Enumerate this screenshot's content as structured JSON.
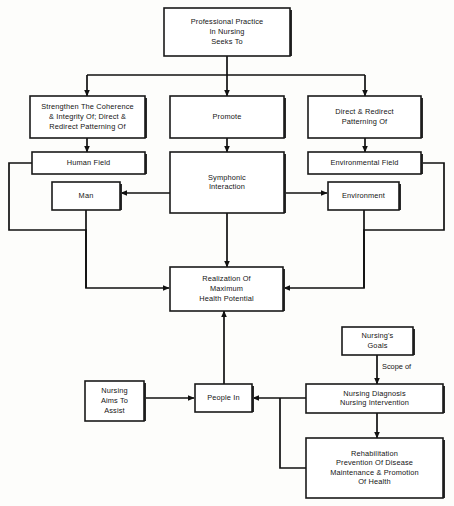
{
  "diagram": {
    "background_color": "#fdfdfb",
    "line_color": "#111111",
    "box_fill": "#ffffff",
    "box_stroke": "#1a1a1a",
    "nodes": [
      {
        "id": "professional_practice",
        "lines": [
          "Professional Practice",
          "In Nursing",
          "Seeks To"
        ],
        "x": 164,
        "y": 8,
        "w": 126,
        "h": 48
      },
      {
        "id": "strengthen",
        "lines": [
          "Strengthen The Coherence",
          "& Integrity Of; Direct &",
          "Redirect Patterning Of"
        ],
        "x": 30,
        "y": 96,
        "w": 115,
        "h": 42
      },
      {
        "id": "promote",
        "lines": [
          "Promote"
        ],
        "x": 170,
        "y": 96,
        "w": 114,
        "h": 42
      },
      {
        "id": "direct_redirect",
        "lines": [
          "Direct & Redirect",
          "Patterning Of"
        ],
        "x": 308,
        "y": 96,
        "w": 113,
        "h": 42
      },
      {
        "id": "human_field",
        "lines": [
          "Human Field"
        ],
        "x": 32,
        "y": 152,
        "w": 113,
        "h": 22
      },
      {
        "id": "symphonic",
        "lines": [
          "Symphonic",
          "Interaction"
        ],
        "x": 170,
        "y": 152,
        "w": 114,
        "h": 61
      },
      {
        "id": "environmental_field",
        "lines": [
          "Environmental Field"
        ],
        "x": 308,
        "y": 152,
        "w": 113,
        "h": 22
      },
      {
        "id": "man",
        "lines": [
          "Man"
        ],
        "x": 52,
        "y": 182,
        "w": 68,
        "h": 28
      },
      {
        "id": "environment",
        "lines": [
          "Environment"
        ],
        "x": 328,
        "y": 182,
        "w": 71,
        "h": 28
      },
      {
        "id": "realization",
        "lines": [
          "Realization Of",
          "Maximum",
          "Health Potential"
        ],
        "x": 170,
        "y": 267,
        "w": 113,
        "h": 44
      },
      {
        "id": "nursings_goals",
        "lines": [
          "Nursing's",
          "Goals"
        ],
        "x": 342,
        "y": 327,
        "w": 71,
        "h": 28
      },
      {
        "id": "nursing_diagnosis",
        "lines": [
          "Nursing Diagnosis",
          "Nursing Intervention"
        ],
        "x": 306,
        "y": 384,
        "w": 137,
        "h": 29
      },
      {
        "id": "nursing_aims",
        "lines": [
          "Nursing",
          "Aims To",
          "Assist"
        ],
        "x": 85,
        "y": 381,
        "w": 59,
        "h": 40
      },
      {
        "id": "people_in",
        "lines": [
          "People In"
        ],
        "x": 195,
        "y": 384,
        "w": 57,
        "h": 28
      },
      {
        "id": "rehabilitation",
        "lines": [
          "Rehabilitation",
          "Prevention Of Disease",
          "Maintenance & Promotion",
          "Of Health"
        ],
        "x": 306,
        "y": 438,
        "w": 137,
        "h": 60
      }
    ],
    "edge_labels": [
      {
        "id": "scope_of",
        "text": "Scope of",
        "x": 382,
        "y": 367
      }
    ],
    "edges": [
      {
        "id": "practice-to-bus",
        "path": "M 227 56 L 227 75",
        "arrow": "none"
      },
      {
        "id": "bus-horizontal",
        "path": "M 87 75 L 365 75",
        "arrow": "none"
      },
      {
        "id": "bus-to-strengthen",
        "path": "M 87 75 L 87 96",
        "arrow": "end"
      },
      {
        "id": "bus-to-promote",
        "path": "M 227 75 L 227 96",
        "arrow": "end"
      },
      {
        "id": "bus-to-direct",
        "path": "M 365 75 L 365 96",
        "arrow": "end"
      },
      {
        "id": "strengthen-to-human-field",
        "path": "M 87 138 L 87 152",
        "arrow": "end"
      },
      {
        "id": "promote-to-symphonic",
        "path": "M 227 138 L 227 152",
        "arrow": "end"
      },
      {
        "id": "direct-to-environmental-field",
        "path": "M 365 138 L 365 152",
        "arrow": "end"
      },
      {
        "id": "symphonic-to-man",
        "path": "M 227 193 L 121 193",
        "arrow": "end"
      },
      {
        "id": "symphonic-to-environment",
        "path": "M 227 193 L 327 193",
        "arrow": "end"
      },
      {
        "id": "human-field-to-man-column",
        "path": "M 32 163 L 9 163 L 9 230 L 86 230 L 86 288",
        "arrow": "none"
      },
      {
        "id": "man-down-to-realization",
        "path": "M 86 210 L 86 288 L 169 288",
        "arrow": "end"
      },
      {
        "id": "environmental-field-to-env-column",
        "path": "M 421 163 L 444 163 L 444 230 L 364 230 L 364 288",
        "arrow": "none"
      },
      {
        "id": "environment-down-to-realization",
        "path": "M 364 210 L 364 288 L 284 288",
        "arrow": "end"
      },
      {
        "id": "symphonic-to-realization",
        "path": "M 227 213 L 227 267",
        "arrow": "end"
      },
      {
        "id": "goals-to-diagnosis",
        "path": "M 377 355 L 377 384",
        "arrow": "end"
      },
      {
        "id": "aims-to-people",
        "path": "M 144 398 L 194 398",
        "arrow": "end"
      },
      {
        "id": "diagnosis-to-people",
        "path": "M 306 398 L 253 398",
        "arrow": "end"
      },
      {
        "id": "people-to-realization",
        "path": "M 224 384 L 224 311",
        "arrow": "end"
      },
      {
        "id": "diagnosis-to-rehabilitation",
        "path": "M 377 413 L 377 438",
        "arrow": "end"
      },
      {
        "id": "rehabilitation-to-people",
        "path": "M 306 468 L 280 468 L 280 398",
        "arrow": "none"
      }
    ]
  }
}
